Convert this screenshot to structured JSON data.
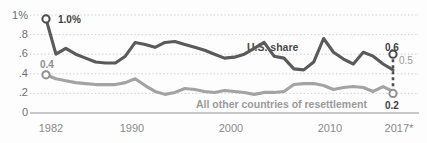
{
  "chart_data": {
    "type": "line",
    "title": "",
    "subtitle": "",
    "xlabel": "",
    "ylabel": "",
    "grid": "horizontal-dotted",
    "legend_position": "inline-annotations",
    "xlim": [
      1982,
      2017
    ],
    "ylim": [
      0,
      1.0
    ],
    "yticks": [
      "0",
      ".2",
      ".4",
      ".6",
      ".8",
      "1%"
    ],
    "ytick_values": [
      0,
      0.2,
      0.4,
      0.6,
      0.8,
      1.0
    ],
    "xticks": [
      "1982",
      "1990",
      "2000",
      "2010",
      "2017*"
    ],
    "xtick_values": [
      1982,
      1990,
      2000,
      2010,
      2017
    ],
    "x": [
      1982,
      1983,
      1984,
      1985,
      1986,
      1987,
      1988,
      1989,
      1990,
      1991,
      1992,
      1993,
      1994,
      1995,
      1996,
      1997,
      1998,
      1999,
      2000,
      2001,
      2002,
      2003,
      2004,
      2005,
      2006,
      2007,
      2008,
      2009,
      2010,
      2011,
      2012,
      2013,
      2014,
      2015,
      2016,
      2017
    ],
    "series": [
      {
        "name": "U.S. share",
        "color": "#5a5a5a",
        "values": [
          0.96,
          0.6,
          0.66,
          0.6,
          0.56,
          0.52,
          0.51,
          0.51,
          0.58,
          0.72,
          0.7,
          0.67,
          0.72,
          0.73,
          0.7,
          0.67,
          0.64,
          0.6,
          0.56,
          0.57,
          0.6,
          0.66,
          0.72,
          0.58,
          0.56,
          0.45,
          0.44,
          0.52,
          0.76,
          0.62,
          0.55,
          0.5,
          0.62,
          0.58,
          0.5,
          0.44
        ],
        "endpoint_value": 0.6,
        "endpoint_label": "0.6",
        "secondary_endpoint_label": "0.5"
      },
      {
        "name": "All other countries of resettlement",
        "color": "#a3a3a3",
        "values": [
          0.39,
          0.35,
          0.33,
          0.31,
          0.3,
          0.29,
          0.29,
          0.29,
          0.31,
          0.35,
          0.28,
          0.22,
          0.19,
          0.21,
          0.25,
          0.24,
          0.22,
          0.21,
          0.23,
          0.22,
          0.21,
          0.19,
          0.21,
          0.21,
          0.22,
          0.29,
          0.3,
          0.3,
          0.28,
          0.24,
          0.26,
          0.27,
          0.26,
          0.22,
          0.27,
          0.22
        ],
        "endpoint_value": 0.2,
        "endpoint_label": "0.2"
      }
    ],
    "annotations": [
      {
        "id": "start-us",
        "text": "1.0%",
        "series": "U.S. share",
        "x": 1982,
        "y": 0.96,
        "marker": "open-circle"
      },
      {
        "id": "start-other",
        "text": "0.4",
        "series": "All other countries of resettlement",
        "x": 1982,
        "y": 0.39,
        "marker": "open-circle"
      },
      {
        "id": "end-us",
        "text": "0.6",
        "series": "U.S. share",
        "x": 2017,
        "y": 0.6,
        "marker": "open-circle"
      },
      {
        "id": "end-us-alt",
        "text": "0.5",
        "series": "U.S. share",
        "x": 2017,
        "y": 0.55,
        "marker": "none"
      },
      {
        "id": "end-other",
        "text": "0.2",
        "series": "All other countries of resettlement",
        "x": 2017,
        "y": 0.2,
        "marker": "open-circle"
      },
      {
        "id": "series-label-us",
        "text": "U.S. share",
        "x": 2006,
        "y": 0.78,
        "marker": "none"
      },
      {
        "id": "series-label-other",
        "text": "All other countries of resettlement",
        "x": 2007,
        "y": 0.09,
        "marker": "none"
      }
    ],
    "dashed_connector": {
      "from": {
        "x": 2017,
        "y": 0.6
      },
      "to": {
        "x": 2017,
        "y": 0.2
      },
      "style": "dashed",
      "color": "#4f4f4f"
    }
  },
  "axis": {
    "y0": "0",
    "y1": ".2",
    "y2": ".4",
    "y3": ".6",
    "y4": ".8",
    "y5": "1%",
    "x0": "1982",
    "x1": "1990",
    "x2": "2000",
    "x3": "2010",
    "x4": "2017*"
  },
  "labels": {
    "us_share": "U.S. share",
    "all_other": "All other countries of resettlement",
    "start_us": "1.0%",
    "start_other": "0.4",
    "end_us": "0.6",
    "end_us_alt": "0.5",
    "end_other": "0.2"
  },
  "colors": {
    "us_line": "#5a5a5a",
    "other_line": "#a3a3a3",
    "grid": "#cfcfcf",
    "axis": "#b0b0b0",
    "tick_text": "#808080"
  }
}
